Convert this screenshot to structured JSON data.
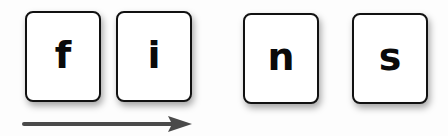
{
  "cards": [
    {
      "letter": "f"
    },
    {
      "letter": "i"
    },
    {
      "letter": "n"
    },
    {
      "letter": "s"
    }
  ],
  "arrow": {
    "direction": "right",
    "color": "#4a4a4a"
  },
  "colors": {
    "card_border": "#111111",
    "card_fill": "#ffffff",
    "letter": "#0a0a0a",
    "background": "#fdfdfd"
  }
}
